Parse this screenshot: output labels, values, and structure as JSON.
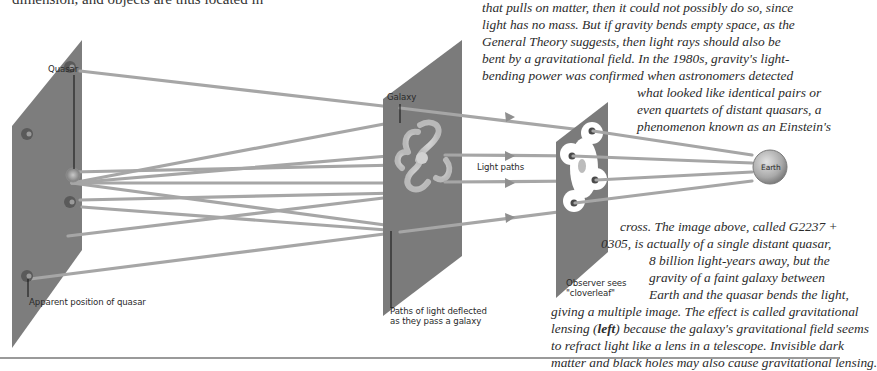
{
  "page": {
    "top_left_fragment": "dimension, and objects are thus located in",
    "body_paragraph_lines": [
      {
        "text": "that pulls on matter, then it could not possibly do so, since",
        "x": 482,
        "y": -1
      },
      {
        "text": "light has no mass. But if gravity bends empty space, as the",
        "x": 482,
        "y": 16
      },
      {
        "text": "General Theory suggests, then light rays should also be",
        "x": 482,
        "y": 33
      },
      {
        "text": "bent by a gravitational field. In the 1980s, gravity's light-",
        "x": 482,
        "y": 50
      },
      {
        "text": "bending power was confirmed when astronomers detected",
        "x": 482,
        "y": 67
      },
      {
        "text": "what looked like identical pairs or",
        "x": 637,
        "y": 84
      },
      {
        "text": "even quartets of distant quasars, a",
        "x": 637,
        "y": 101
      },
      {
        "text": "phenomenon known as an Einstein's",
        "x": 637,
        "y": 118
      },
      {
        "text": "cross. The image above, called G2237 +",
        "x": 620,
        "y": 218
      },
      {
        "text": "0305, is actually of a single distant quasar,",
        "x": 601,
        "y": 235
      },
      {
        "text": "8 billion light-years away, but the",
        "x": 649,
        "y": 252
      },
      {
        "text": "gravity of a faint galaxy between",
        "x": 649,
        "y": 269
      },
      {
        "text": "Earth and the quasar bends the light,",
        "x": 649,
        "y": 286
      }
    ],
    "lensing_lines": {
      "line1": "giving a multiple image. The effect is called gravitational",
      "line2_before": "lensing (",
      "line2_bold": "left",
      "line2_after": ") because the galaxy's gravitational field seems",
      "line3": "to refract light like a lens in a telescope. Invisible dark",
      "line4": "matter and black holes may also cause gravitational lensing."
    }
  },
  "diagram": {
    "labels": {
      "quasar": "Quasar",
      "apparent_position": "Apparent position of quasar",
      "galaxy": "Galaxy",
      "paths_deflected_line1": "Paths of light deflected",
      "paths_deflected_line2": "as they pass a galaxy",
      "light_paths": "Light paths",
      "observer_line1": "Observer sees",
      "observer_line2": "\"cloverleaf\"",
      "earth": "Earth"
    },
    "colors": {
      "panel": "#7b7b7b",
      "panel_dark": "#5e5e5e",
      "ray": "#a8a8a8",
      "ray_arrow": "#8f8f8f",
      "earth_fill": "#b9b9b9",
      "quasar_glow": "#9c9c9c",
      "cloverleaf": "#ffffff"
    }
  }
}
